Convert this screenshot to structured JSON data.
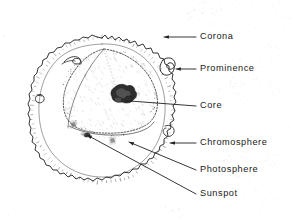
{
  "figure": {
    "style": "hand-drawn pen-and-ink line art, stippled shading",
    "background_color": "#ffffff",
    "ink_color": "#2b2b2b",
    "canvas": {
      "width": 292,
      "height": 220
    }
  },
  "labels": [
    {
      "id": "corona",
      "text": "Corona",
      "text_x": 200,
      "text_y": 37,
      "line_from_x": 196,
      "line_from_y": 37,
      "line_to_x": 164,
      "line_to_y": 37,
      "arrow": true,
      "arrow_dir": "left",
      "points_to": "outer stippled halo beyond the disc"
    },
    {
      "id": "prominence",
      "text": "Prominence",
      "text_x": 200,
      "text_y": 69,
      "line_from_x": 196,
      "line_from_y": 69,
      "line_to_x": 176,
      "line_to_y": 69,
      "arrow": true,
      "arrow_dir": "left",
      "points_to": "looping flare arc on the upper-right rim"
    },
    {
      "id": "core",
      "text": "Core",
      "text_x": 200,
      "text_y": 106,
      "line_from_x": 196,
      "line_from_y": 106,
      "line_to_x": 130,
      "line_to_y": 101,
      "arrow": false,
      "arrow_dir": "none",
      "points_to": "dark irregular blob at centre of cutaway"
    },
    {
      "id": "chromosphere",
      "text": "Chromosphere",
      "text_x": 200,
      "text_y": 143,
      "line_from_x": 196,
      "line_from_y": 143,
      "line_to_x": 170,
      "line_to_y": 143,
      "arrow": true,
      "arrow_dir": "left",
      "points_to": "jagged spiky outer rim of the disc"
    },
    {
      "id": "photosphere",
      "text": "Photosphere",
      "text_x": 200,
      "text_y": 170,
      "line_from_x": 196,
      "line_from_y": 170,
      "line_to_x": 129,
      "line_to_y": 142,
      "arrow": true,
      "arrow_dir": "upleft",
      "points_to": "visible bright surface inside the rim"
    },
    {
      "id": "sunspot",
      "text": "Sunspot",
      "text_x": 200,
      "text_y": 194,
      "line_from_x": 196,
      "line_from_y": 194,
      "line_to_x": 87,
      "line_to_y": 135,
      "arrow": true,
      "arrow_dir": "upleft",
      "points_to": "small dark blemish on the lower-left surface"
    }
  ],
  "diagram_parts": {
    "disc": {
      "name": "solar-disc",
      "center_x": 102,
      "center_y": 110,
      "radius_x": 70,
      "radius_y": 72,
      "description": "roughly circular hand-drawn outline with ragged edge"
    },
    "cutaway": {
      "name": "cutaway-wedge",
      "description": "upper-right quadrant opened to expose interior, bounded by dotted/hatched arc"
    },
    "core": {
      "name": "core-blob",
      "center_x": 122,
      "center_y": 95,
      "description": "dark scribbled mass at the centre of the interior"
    },
    "sunspots": [
      {
        "name": "sunspot-left",
        "x": 73,
        "y": 124
      },
      {
        "name": "sunspot-lower",
        "x": 87,
        "y": 135
      },
      {
        "name": "sunspot-mid",
        "x": 112,
        "y": 140
      }
    ],
    "prominences": [
      {
        "name": "prominence-upper-right",
        "x": 170,
        "y": 68
      },
      {
        "name": "prominence-upper-left",
        "x": 72,
        "y": 60
      },
      {
        "name": "prominence-left",
        "x": 48,
        "y": 97
      },
      {
        "name": "prominence-lower-right",
        "x": 168,
        "y": 130
      }
    ],
    "corona": {
      "name": "corona-halo",
      "description": "faint grey stipple radiating outward from the disc in rays"
    }
  }
}
